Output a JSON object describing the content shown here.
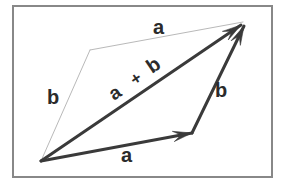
{
  "figure": {
    "background_color": "#ffffff",
    "frame": {
      "name": "outer-border",
      "x": 13,
      "y": 6,
      "width": 259,
      "height": 171,
      "stroke_color": "#888888",
      "stroke_width": 2,
      "fill_color": "#ffffff"
    },
    "colors": {
      "vector_stroke": "#3a3a3a",
      "guide_stroke": "#b9b9b9",
      "label_text": "#2b2b2b"
    },
    "geometry": {
      "origin": {
        "x": 41,
        "y": 161
      },
      "a_tip": {
        "x": 192,
        "y": 133
      },
      "sum_tip": {
        "x": 243,
        "y": 23
      },
      "b_corner": {
        "x": 90,
        "y": 50
      }
    },
    "vectors": [
      {
        "name": "vector-a-bottom",
        "label": "a",
        "style": "solid-bold",
        "x1": 41,
        "y1": 161,
        "x2": 192,
        "y2": 133,
        "stroke_width": 3,
        "arrowhead": true
      },
      {
        "name": "vector-b-right",
        "label": "b",
        "style": "solid-bold",
        "x1": 192,
        "y1": 133,
        "x2": 244,
        "y2": 26,
        "stroke_width": 3,
        "arrowhead": true
      },
      {
        "name": "vector-a-plus-b",
        "label": "a + b",
        "style": "solid-bold",
        "x1": 41,
        "y1": 161,
        "x2": 241,
        "y2": 25,
        "stroke_width": 3,
        "arrowhead": true
      }
    ],
    "guides": [
      {
        "name": "guide-b-left",
        "label": "b",
        "style": "thin",
        "x1": 41,
        "y1": 161,
        "x2": 90,
        "y2": 50,
        "stroke_width": 1,
        "arrowhead": false
      },
      {
        "name": "guide-a-top",
        "label": "a",
        "style": "thin",
        "x1": 90,
        "y1": 50,
        "x2": 243,
        "y2": 22,
        "stroke_width": 1,
        "arrowhead": false
      }
    ],
    "labels": [
      {
        "name": "label-a-top",
        "text": "a",
        "x": 153,
        "y": 34,
        "rotation": 0,
        "font_size": 20
      },
      {
        "name": "label-b-left",
        "text": "b",
        "x": 47,
        "y": 104,
        "rotation": 0,
        "font_size": 20
      },
      {
        "name": "label-sum-a",
        "text": "a",
        "x": 114,
        "y": 101,
        "rotation": -34,
        "font_size": 19
      },
      {
        "name": "label-sum-plus",
        "text": "+",
        "x": 135,
        "y": 86,
        "rotation": -34,
        "font_size": 17
      },
      {
        "name": "label-sum-b",
        "text": "b",
        "x": 152,
        "y": 74,
        "rotation": -34,
        "font_size": 20
      },
      {
        "name": "label-b-right",
        "text": "b",
        "x": 215,
        "y": 97,
        "rotation": 0,
        "font_size": 20
      },
      {
        "name": "label-a-bottom",
        "text": "a",
        "x": 121,
        "y": 162,
        "rotation": 0,
        "font_size": 20
      }
    ]
  }
}
